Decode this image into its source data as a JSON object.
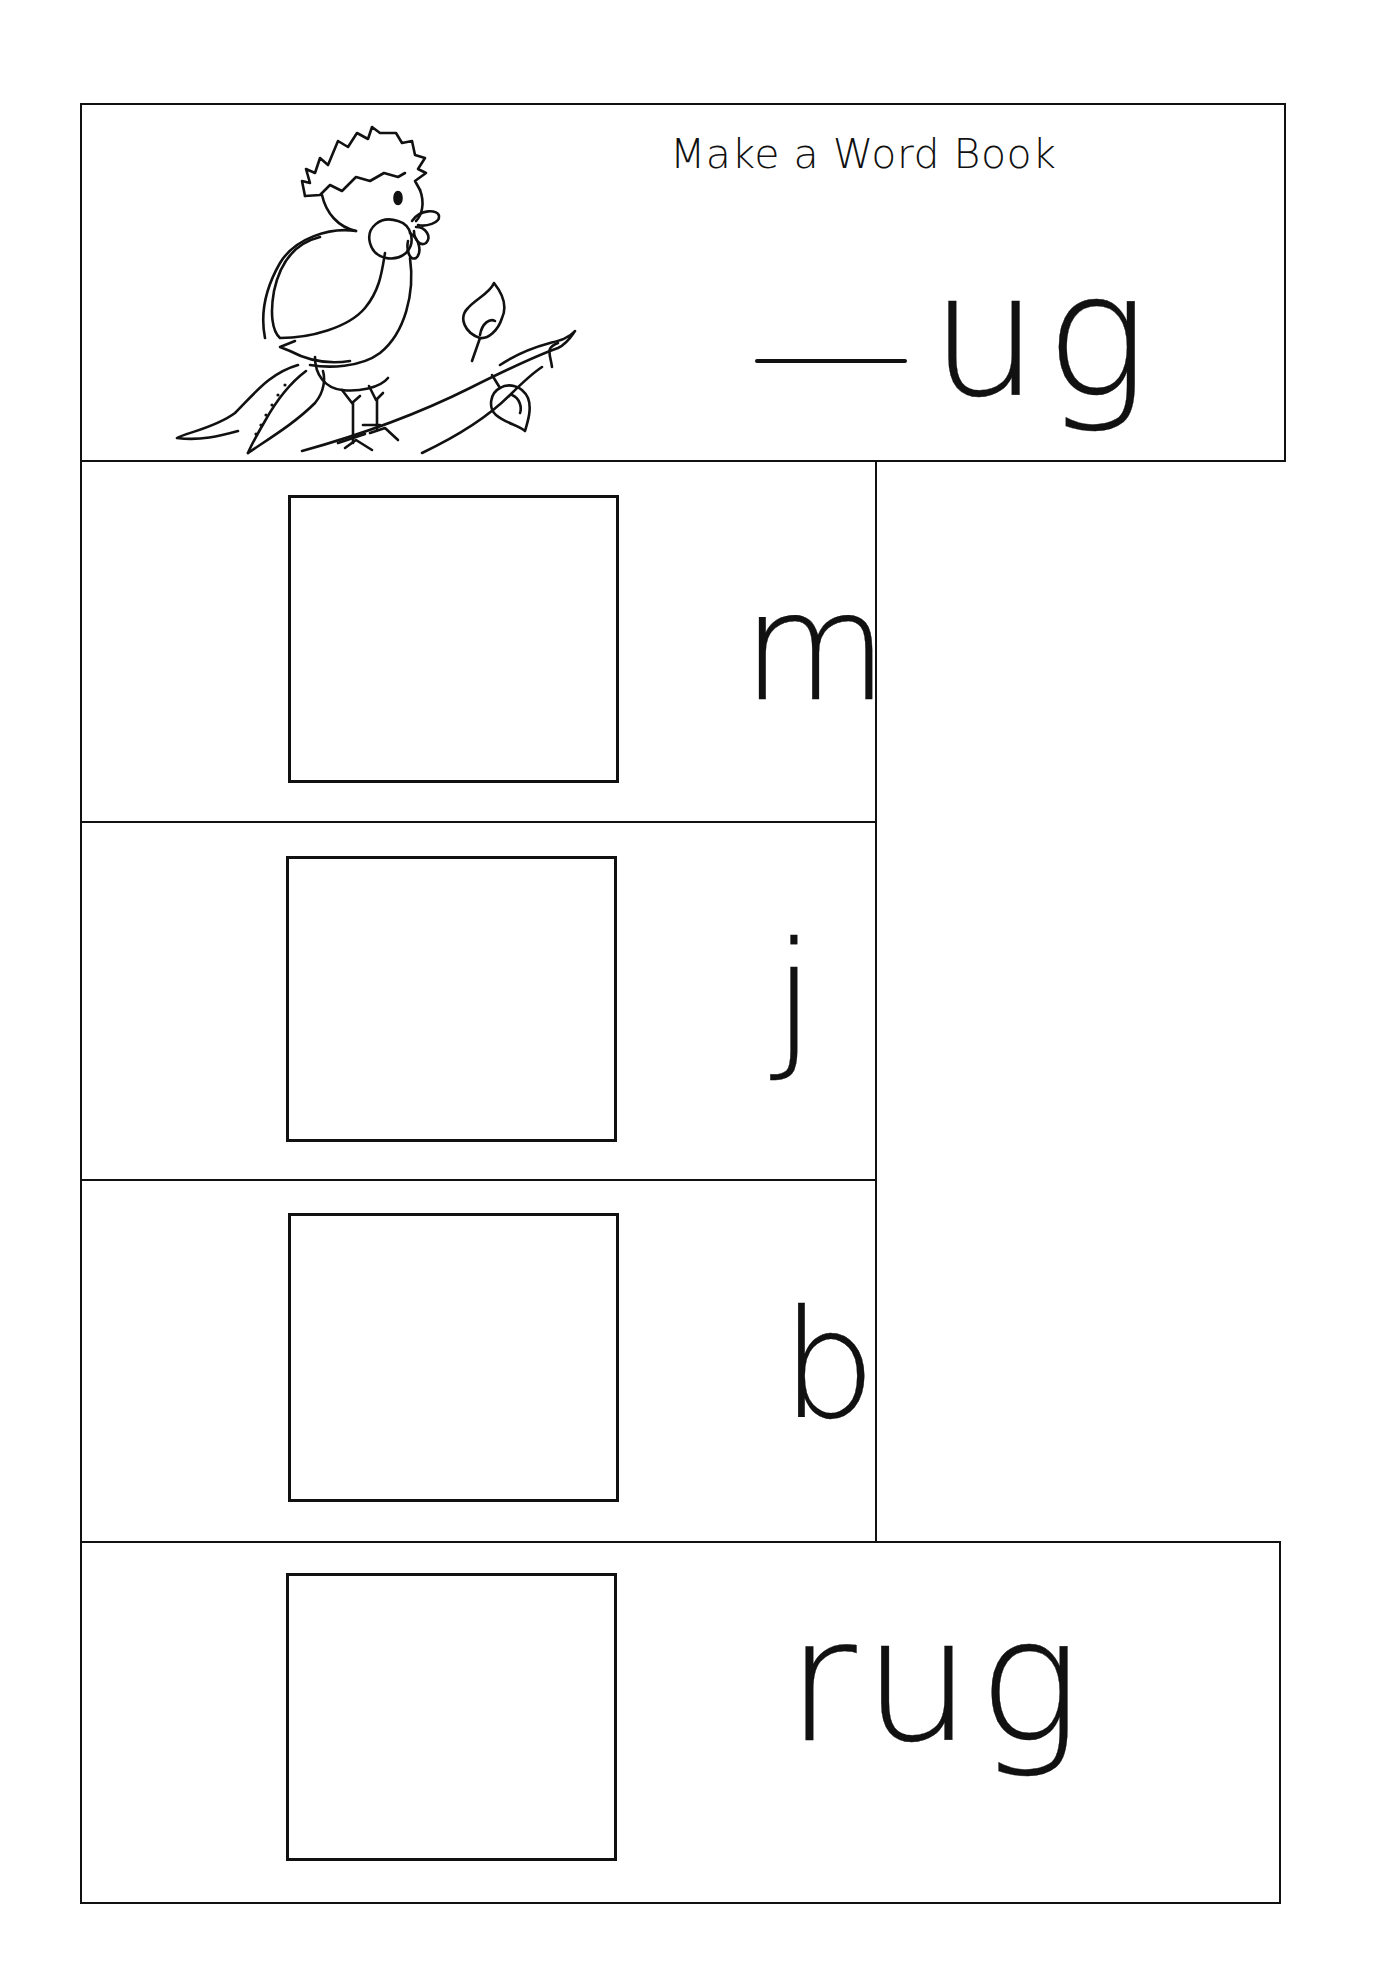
{
  "worksheet": {
    "title": "Make a Word Book",
    "word_family": {
      "blank": "___",
      "ending": "ug"
    },
    "illustration": "bird-on-branch-icon",
    "pages": [
      {
        "letter": "m",
        "picture_box": "empty"
      },
      {
        "letter": "j",
        "picture_box": "empty"
      },
      {
        "letter": "b",
        "picture_box": "empty"
      },
      {
        "word": "rug",
        "picture_box": "empty"
      }
    ],
    "colors": {
      "ink": "#111111",
      "paper": "#ffffff"
    }
  }
}
